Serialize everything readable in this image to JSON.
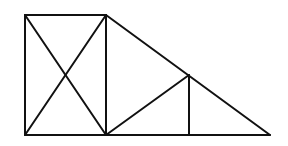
{
  "diagram": {
    "type": "geometric-figure",
    "stroke_color": "#111111",
    "background": "#ffffff",
    "points": {
      "A": [
        25,
        15
      ],
      "B": [
        106,
        15
      ],
      "C": [
        25,
        135
      ],
      "D": [
        106,
        135
      ],
      "E": [
        189,
        75
      ],
      "F": [
        189,
        135
      ],
      "G": [
        270,
        135
      ]
    },
    "segments": [
      {
        "id": "rect-top",
        "from": "A",
        "to": "B"
      },
      {
        "id": "rect-left",
        "from": "A",
        "to": "C"
      },
      {
        "id": "rect-right",
        "from": "B",
        "to": "D"
      },
      {
        "id": "base",
        "from": "C",
        "to": "G"
      },
      {
        "id": "diag-ad",
        "from": "A",
        "to": "D"
      },
      {
        "id": "diag-cb",
        "from": "C",
        "to": "B"
      },
      {
        "id": "hypotenuse",
        "from": "B",
        "to": "G"
      },
      {
        "id": "diag-de",
        "from": "D",
        "to": "E"
      },
      {
        "id": "vertical-ef",
        "from": "E",
        "to": "F"
      }
    ]
  }
}
